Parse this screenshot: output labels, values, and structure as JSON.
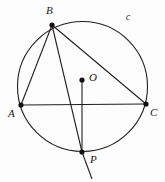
{
  "figure": {
    "background_color": "#fdfdfd",
    "stroke_color": "#231f20",
    "point_color": "#111111",
    "canvas": {
      "width": 165,
      "height": 182
    }
  },
  "circle": {
    "name": "circle-c",
    "label": "c",
    "center": {
      "x": 82.5,
      "y": 86.5
    },
    "radius": 65,
    "label_position": {
      "x": 126,
      "y": 14
    }
  },
  "points": [
    {
      "id": "B",
      "label": "B",
      "x": 52,
      "y": 25,
      "label_position": {
        "x": 46,
        "y": 7
      },
      "on_circle": true
    },
    {
      "id": "A",
      "label": "A",
      "x": 21,
      "y": 105,
      "label_position": {
        "x": 9,
        "y": 110
      },
      "on_circle": true
    },
    {
      "id": "C",
      "label": "C",
      "x": 146,
      "y": 104,
      "label_position": {
        "x": 150,
        "y": 108
      },
      "on_circle": true
    },
    {
      "id": "O",
      "label": "O",
      "x": 82,
      "y": 80,
      "label_position": {
        "x": 89,
        "y": 73
      },
      "on_circle": false
    },
    {
      "id": "P",
      "label": "P",
      "x": 82,
      "y": 152,
      "label_position": {
        "x": 90,
        "y": 155
      },
      "on_circle": true
    }
  ],
  "segments": [
    {
      "name": "segment-AC",
      "from": "A",
      "to": "C",
      "label": "AC"
    },
    {
      "name": "segment-BA",
      "from": "B",
      "to": "A",
      "label": "BA"
    },
    {
      "name": "segment-BC",
      "from": "B",
      "to": "C",
      "label": "BC"
    },
    {
      "name": "segment-BP",
      "from": "B",
      "to": "P",
      "label": "BP"
    },
    {
      "name": "segment-OP",
      "from": "O",
      "to": "P",
      "label": "OP"
    }
  ],
  "ray": {
    "name": "ray-BP-extension",
    "from": {
      "x": 82,
      "y": 152
    },
    "to": {
      "x": 92,
      "y": 179
    }
  }
}
